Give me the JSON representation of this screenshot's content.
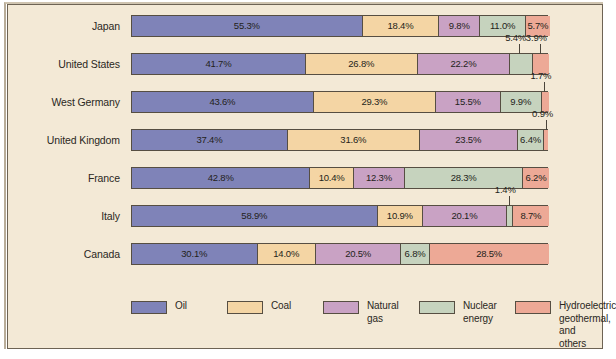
{
  "chart_data": {
    "type": "bar",
    "orientation": "horizontal",
    "stacked": true,
    "stack_total": 100,
    "title": "",
    "xlabel": "",
    "ylabel": "",
    "xlim": [
      0,
      100
    ],
    "grid": false,
    "legend_position": "bottom",
    "categories": [
      "Japan",
      "United States",
      "West Germany",
      "United Kingdom",
      "France",
      "Italy",
      "Canada"
    ],
    "series": [
      {
        "name": "Oil",
        "color": "#7f83b8",
        "values": [
          55.3,
          41.7,
          43.6,
          37.4,
          42.8,
          58.9,
          30.1
        ]
      },
      {
        "name": "Coal",
        "color": "#f4d5a4",
        "values": [
          18.4,
          26.8,
          29.3,
          31.6,
          10.4,
          10.9,
          14.0
        ]
      },
      {
        "name": "Natural gas",
        "color": "#c9a2c4",
        "values": [
          9.8,
          22.2,
          15.5,
          23.5,
          12.3,
          20.1,
          20.5
        ]
      },
      {
        "name": "Nuclear energy",
        "color": "#c6d3be",
        "values": [
          11.0,
          5.4,
          9.9,
          6.4,
          28.3,
          1.4,
          6.8
        ]
      },
      {
        "name": "Hydroelectric geothermal, and others",
        "color": "#eda996",
        "values": [
          5.7,
          3.9,
          1.7,
          0.9,
          6.2,
          8.7,
          28.5
        ]
      }
    ],
    "data_labels": [
      {
        "category": "Japan",
        "series": "Oil",
        "text": "55.3%",
        "placement": "inside"
      },
      {
        "category": "Japan",
        "series": "Coal",
        "text": "18.4%",
        "placement": "inside"
      },
      {
        "category": "Japan",
        "series": "Natural gas",
        "text": "9.8%",
        "placement": "inside"
      },
      {
        "category": "Japan",
        "series": "Nuclear energy",
        "text": "11.0%",
        "placement": "inside"
      },
      {
        "category": "Japan",
        "series": "Hydroelectric geothermal, and others",
        "text": "5.7%",
        "placement": "inside"
      },
      {
        "category": "United States",
        "series": "Oil",
        "text": "41.7%",
        "placement": "inside"
      },
      {
        "category": "United States",
        "series": "Coal",
        "text": "26.8%",
        "placement": "inside"
      },
      {
        "category": "United States",
        "series": "Natural gas",
        "text": "22.2%",
        "placement": "inside"
      },
      {
        "category": "United States",
        "series": "Nuclear energy",
        "text": "5.4%",
        "placement": "callout-above"
      },
      {
        "category": "United States",
        "series": "Hydroelectric geothermal, and others",
        "text": "3.9%",
        "placement": "callout-above"
      },
      {
        "category": "West Germany",
        "series": "Oil",
        "text": "43.6%",
        "placement": "inside"
      },
      {
        "category": "West Germany",
        "series": "Coal",
        "text": "29.3%",
        "placement": "inside"
      },
      {
        "category": "West Germany",
        "series": "Natural gas",
        "text": "15.5%",
        "placement": "inside"
      },
      {
        "category": "West Germany",
        "series": "Nuclear energy",
        "text": "9.9%",
        "placement": "inside"
      },
      {
        "category": "West Germany",
        "series": "Hydroelectric geothermal, and others",
        "text": "1.7%",
        "placement": "callout-above"
      },
      {
        "category": "United Kingdom",
        "series": "Oil",
        "text": "37.4%",
        "placement": "inside"
      },
      {
        "category": "United Kingdom",
        "series": "Coal",
        "text": "31.6%",
        "placement": "inside"
      },
      {
        "category": "United Kingdom",
        "series": "Natural gas",
        "text": "23.5%",
        "placement": "inside"
      },
      {
        "category": "United Kingdom",
        "series": "Nuclear energy",
        "text": "6.4%",
        "placement": "inside"
      },
      {
        "category": "United Kingdom",
        "series": "Hydroelectric geothermal, and others",
        "text": "0.9%",
        "placement": "callout-above"
      },
      {
        "category": "France",
        "series": "Oil",
        "text": "42.8%",
        "placement": "inside"
      },
      {
        "category": "France",
        "series": "Coal",
        "text": "10.4%",
        "placement": "inside"
      },
      {
        "category": "France",
        "series": "Natural gas",
        "text": "12.3%",
        "placement": "inside"
      },
      {
        "category": "France",
        "series": "Nuclear energy",
        "text": "28.3%",
        "placement": "inside"
      },
      {
        "category": "France",
        "series": "Hydroelectric geothermal, and others",
        "text": "6.2%",
        "placement": "inside"
      },
      {
        "category": "Italy",
        "series": "Oil",
        "text": "58.9%",
        "placement": "inside"
      },
      {
        "category": "Italy",
        "series": "Coal",
        "text": "10.9%",
        "placement": "inside"
      },
      {
        "category": "Italy",
        "series": "Natural gas",
        "text": "20.1%",
        "placement": "inside"
      },
      {
        "category": "Italy",
        "series": "Nuclear energy",
        "text": "1.4%",
        "placement": "callout-above"
      },
      {
        "category": "Italy",
        "series": "Hydroelectric geothermal, and others",
        "text": "8.7%",
        "placement": "inside"
      },
      {
        "category": "Canada",
        "series": "Oil",
        "text": "30.1%",
        "placement": "inside"
      },
      {
        "category": "Canada",
        "series": "Coal",
        "text": "14.0%",
        "placement": "inside"
      },
      {
        "category": "Canada",
        "series": "Natural gas",
        "text": "20.5%",
        "placement": "inside"
      },
      {
        "category": "Canada",
        "series": "Nuclear energy",
        "text": "6.8%",
        "placement": "inside"
      },
      {
        "category": "Canada",
        "series": "Hydroelectric geothermal, and others",
        "text": "28.5%",
        "placement": "inside"
      }
    ]
  },
  "rows": [
    {
      "label": "Japan",
      "segments": [
        {
          "series": "Oil",
          "value": 55.3,
          "label": "55.3%",
          "show_label": true
        },
        {
          "series": "Coal",
          "value": 18.4,
          "label": "18.4%",
          "show_label": true
        },
        {
          "series": "Natural gas",
          "value": 9.8,
          "label": "9.8%",
          "show_label": true
        },
        {
          "series": "Nuclear energy",
          "value": 11.0,
          "label": "11.0%",
          "show_label": true
        },
        {
          "series": "Hydroelectric geothermal, and others",
          "value": 5.7,
          "label": "5.7%",
          "show_label": true
        }
      ],
      "callouts": []
    },
    {
      "label": "United States",
      "segments": [
        {
          "series": "Oil",
          "value": 41.7,
          "label": "41.7%",
          "show_label": true
        },
        {
          "series": "Coal",
          "value": 26.8,
          "label": "26.8%",
          "show_label": true
        },
        {
          "series": "Natural gas",
          "value": 22.2,
          "label": "22.2%",
          "show_label": true
        },
        {
          "series": "Nuclear energy",
          "value": 5.4,
          "label": "5.4%",
          "show_label": false
        },
        {
          "series": "Hydroelectric geothermal, and others",
          "value": 3.9,
          "label": "3.9%",
          "show_label": false
        }
      ],
      "callouts": [
        {
          "text": "5.4%",
          "target_center": 93.1
        },
        {
          "text": "3.9%",
          "target_center": 98.05
        }
      ]
    },
    {
      "label": "West Germany",
      "segments": [
        {
          "series": "Oil",
          "value": 43.6,
          "label": "43.6%",
          "show_label": true
        },
        {
          "series": "Coal",
          "value": 29.3,
          "label": "29.3%",
          "show_label": true
        },
        {
          "series": "Natural gas",
          "value": 15.5,
          "label": "15.5%",
          "show_label": true
        },
        {
          "series": "Nuclear energy",
          "value": 9.9,
          "label": "9.9%",
          "show_label": true
        },
        {
          "series": "Hydroelectric geothermal, and others",
          "value": 1.7,
          "label": "1.7%",
          "show_label": false
        }
      ],
      "callouts": [
        {
          "text": "1.7%",
          "target_center": 99.15
        }
      ]
    },
    {
      "label": "United Kingdom",
      "segments": [
        {
          "series": "Oil",
          "value": 37.4,
          "label": "37.4%",
          "show_label": true
        },
        {
          "series": "Coal",
          "value": 31.6,
          "label": "31.6%",
          "show_label": true
        },
        {
          "series": "Natural gas",
          "value": 23.5,
          "label": "23.5%",
          "show_label": true
        },
        {
          "series": "Nuclear energy",
          "value": 6.4,
          "label": "6.4%",
          "show_label": true
        },
        {
          "series": "Hydroelectric geothermal, and others",
          "value": 0.9,
          "label": "0.9%",
          "show_label": false
        }
      ],
      "callouts": [
        {
          "text": "0.9%",
          "target_center": 99.55
        }
      ]
    },
    {
      "label": "France",
      "segments": [
        {
          "series": "Oil",
          "value": 42.8,
          "label": "42.8%",
          "show_label": true
        },
        {
          "series": "Coal",
          "value": 10.4,
          "label": "10.4%",
          "show_label": true
        },
        {
          "series": "Natural gas",
          "value": 12.3,
          "label": "12.3%",
          "show_label": true
        },
        {
          "series": "Nuclear energy",
          "value": 28.3,
          "label": "28.3%",
          "show_label": true
        },
        {
          "series": "Hydroelectric geothermal, and others",
          "value": 6.2,
          "label": "6.2%",
          "show_label": true
        }
      ],
      "callouts": []
    },
    {
      "label": "Italy",
      "segments": [
        {
          "series": "Oil",
          "value": 58.9,
          "label": "58.9%",
          "show_label": true
        },
        {
          "series": "Coal",
          "value": 10.9,
          "label": "10.9%",
          "show_label": true
        },
        {
          "series": "Natural gas",
          "value": 20.1,
          "label": "20.1%",
          "show_label": true
        },
        {
          "series": "Nuclear energy",
          "value": 1.4,
          "label": "1.4%",
          "show_label": false
        },
        {
          "series": "Hydroelectric geothermal, and others",
          "value": 8.7,
          "label": "8.7%",
          "show_label": true
        }
      ],
      "callouts": [
        {
          "text": "1.4%",
          "target_center": 90.6
        }
      ]
    },
    {
      "label": "Canada",
      "segments": [
        {
          "series": "Oil",
          "value": 30.1,
          "label": "30.1%",
          "show_label": true
        },
        {
          "series": "Coal",
          "value": 14.0,
          "label": "14.0%",
          "show_label": true
        },
        {
          "series": "Natural gas",
          "value": 20.5,
          "label": "20.5%",
          "show_label": true
        },
        {
          "series": "Nuclear energy",
          "value": 6.8,
          "label": "6.8%",
          "show_label": true
        },
        {
          "series": "Hydroelectric geothermal, and others",
          "value": 28.5,
          "label": "28.5%",
          "show_label": true
        }
      ],
      "callouts": []
    }
  ],
  "legend": {
    "items": [
      {
        "label_lines": [
          "Oil"
        ],
        "color": "#7f83b8",
        "x": 0
      },
      {
        "label_lines": [
          "Coal"
        ],
        "color": "#f4d5a4",
        "x": 96
      },
      {
        "label_lines": [
          "Natural",
          "gas"
        ],
        "color": "#c9a2c4",
        "x": 192
      },
      {
        "label_lines": [
          "Nuclear",
          "energy"
        ],
        "color": "#c6d3be",
        "x": 288
      },
      {
        "label_lines": [
          "Hydroelectric",
          "geothermal, and",
          "others"
        ],
        "color": "#eda996",
        "x": 384
      }
    ]
  },
  "colors": {
    "background": "#f3e9d6",
    "frame": "#6d6354",
    "segment_border": "#564e42",
    "text": "#2a2722"
  }
}
